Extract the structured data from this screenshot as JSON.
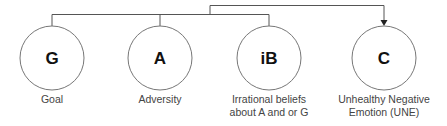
{
  "diagram": {
    "type": "flow",
    "nodes": [
      {
        "id": "G",
        "letter": "G",
        "label_lines": [
          "Goal"
        ]
      },
      {
        "id": "A",
        "letter": "A",
        "label_lines": [
          "Adversity"
        ]
      },
      {
        "id": "iB",
        "letter": "iB",
        "label_lines": [
          "Irrational beliefs",
          "about A and or G"
        ]
      },
      {
        "id": "C",
        "letter": "C",
        "label_lines": [
          "Unhealthy Negative",
          "Emotion (UNE)"
        ]
      }
    ],
    "edges": [
      {
        "from": [
          "G",
          "A",
          "iB"
        ],
        "to": "C",
        "arrow": true
      }
    ],
    "colors": {
      "line": "#555555",
      "circle_stroke": "#777777",
      "letter": "#111111",
      "label": "#444444"
    }
  }
}
